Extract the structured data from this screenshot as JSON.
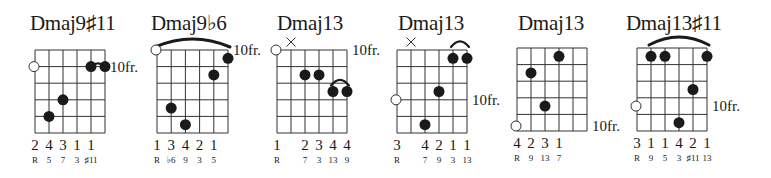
{
  "page": {
    "width": 771,
    "height": 178
  },
  "colors": {
    "ink": "#1a1a1a",
    "background": "#ffffff"
  },
  "diagram": {
    "strings": 6,
    "frets_shown": 5,
    "chords": [
      {
        "name": "Dmaj9♯11",
        "fret_label": "10fr.",
        "fret_label_row": 1,
        "grid": {
          "x": 35,
          "y": 50,
          "w": 70,
          "h": 83
        },
        "title_x": 30,
        "muted": [],
        "open_markers": [
          {
            "string": 0,
            "row": 1
          }
        ],
        "dots": [
          {
            "string": 1,
            "fret": 4
          },
          {
            "string": 2,
            "fret": 3
          },
          {
            "string": 4,
            "fret": 1
          },
          {
            "string": 5,
            "fret": 1
          }
        ],
        "barre": {
          "from": 4,
          "to": 5,
          "fret": 1
        },
        "fingers": [
          "2",
          "4",
          "3",
          "1",
          "1",
          ""
        ],
        "intervals": [
          "R",
          "5",
          "7",
          "3",
          "♯11",
          ""
        ]
      },
      {
        "name": "Dmaj9♭6",
        "fret_label": "10fr.",
        "fret_label_row": 0,
        "grid": {
          "x": 157,
          "y": 50,
          "w": 71,
          "h": 83
        },
        "title_x": 151,
        "muted": [],
        "open_markers": [
          {
            "string": 0,
            "row": 0
          }
        ],
        "dots": [
          {
            "string": 5,
            "fret": 0.5
          },
          {
            "string": 4,
            "fret": 1.5
          },
          {
            "string": 1,
            "fret": 3.5
          },
          {
            "string": 2,
            "fret": 4.5
          }
        ],
        "barre": {
          "from": 0,
          "to": 5,
          "fret": 0
        },
        "fingers": [
          "1",
          "3",
          "4",
          "2",
          "1",
          ""
        ],
        "intervals": [
          "R",
          "♭6",
          "9",
          "3",
          "5",
          ""
        ]
      },
      {
        "name": "Dmaj13",
        "fret_label": "10fr.",
        "fret_label_row": 0,
        "grid": {
          "x": 277,
          "y": 50,
          "w": 70,
          "h": 83
        },
        "title_x": 277,
        "muted": [
          1
        ],
        "open_markers": [
          {
            "string": 0,
            "row": 0
          }
        ],
        "dots": [
          {
            "string": 2,
            "fret": 1.5
          },
          {
            "string": 3,
            "fret": 1.5
          },
          {
            "string": 4,
            "fret": 2.5
          },
          {
            "string": 5,
            "fret": 2.5
          }
        ],
        "barre": {
          "from": 4,
          "to": 5,
          "fret": 2
        },
        "fingers": [
          "1",
          "",
          "2",
          "3",
          "4",
          "4"
        ],
        "intervals": [
          "R",
          "",
          "7",
          "3",
          "13",
          "9"
        ]
      },
      {
        "name": "Dmaj13",
        "fret_label": "10fr.",
        "fret_label_row": 3,
        "grid": {
          "x": 397,
          "y": 50,
          "w": 70,
          "h": 83
        },
        "title_x": 398,
        "muted": [
          1
        ],
        "open_markers": [
          {
            "string": 0,
            "row": 3
          }
        ],
        "dots": [
          {
            "string": 4,
            "fret": 0.5
          },
          {
            "string": 5,
            "fret": 0.5
          },
          {
            "string": 3,
            "fret": 2.5
          },
          {
            "string": 2,
            "fret": 4.5
          }
        ],
        "barre": {
          "from": 4,
          "to": 5,
          "fret": 0
        },
        "fingers": [
          "3",
          "",
          "4",
          "2",
          "1",
          "1"
        ],
        "intervals": [
          "R",
          "",
          "7",
          "9",
          "3",
          "13"
        ]
      },
      {
        "name": "Dmaj13",
        "fret_label": "10fr.",
        "fret_label_row": 4.7,
        "grid": {
          "x": 517,
          "y": 48,
          "w": 70,
          "h": 83
        },
        "title_x": 518,
        "muted": [],
        "open_markers": [
          {
            "string": 0,
            "row": 4.7
          }
        ],
        "dots": [
          {
            "string": 3,
            "fret": 0.5
          },
          {
            "string": 1,
            "fret": 1.5
          },
          {
            "string": 2,
            "fret": 3.5
          }
        ],
        "barre": null,
        "fingers": [
          "4",
          "2",
          "3",
          "1",
          "",
          ""
        ],
        "intervals": [
          "R",
          "9",
          "13",
          "7",
          "",
          ""
        ]
      },
      {
        "name": "Dmaj13♯11",
        "fret_label": "10fr.",
        "fret_label_row": 3.5,
        "grid": {
          "x": 637,
          "y": 48,
          "w": 70,
          "h": 83
        },
        "title_x": 626,
        "muted": [],
        "open_markers": [
          {
            "string": 0,
            "row": 3.5
          }
        ],
        "dots": [
          {
            "string": 1,
            "fret": 0.5
          },
          {
            "string": 2,
            "fret": 0.5
          },
          {
            "string": 5,
            "fret": 0.5
          },
          {
            "string": 4,
            "fret": 2.5
          },
          {
            "string": 3,
            "fret": 4.5
          }
        ],
        "barre": {
          "from": 1,
          "to": 5,
          "fret": 0
        },
        "fingers": [
          "3",
          "1",
          "1",
          "4",
          "2",
          "1"
        ],
        "intervals": [
          "R",
          "9",
          "5",
          "3",
          "♯11",
          "13"
        ]
      }
    ]
  }
}
